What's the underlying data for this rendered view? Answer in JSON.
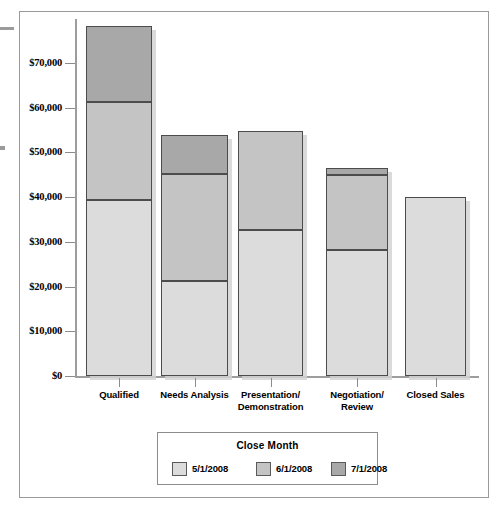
{
  "chart_data": {
    "type": "bar",
    "subtype": "stacked-vertical",
    "title": "",
    "xlabel": "",
    "ylabel": "",
    "categories": [
      "Qualified",
      "Needs Analysis",
      "Presentation/ Demonstration",
      "Negotiation/ Review",
      "Closed Sales"
    ],
    "category_lines": [
      [
        "Qualified"
      ],
      [
        "Needs Analysis"
      ],
      [
        "Presentation/",
        "Demonstration"
      ],
      [
        "Negotiation/",
        "Review"
      ],
      [
        "Closed Sales"
      ]
    ],
    "legend_title": "Close Month",
    "legend_position": "bottom",
    "grid": false,
    "ylim": [
      0,
      80000
    ],
    "yticks": [
      0,
      10000,
      20000,
      30000,
      40000,
      50000,
      60000,
      70000
    ],
    "ytick_labels": [
      "$0",
      "$10,000",
      "$20,000",
      "$30,000",
      "$40,000",
      "$50,000",
      "$60,000",
      "$70,000"
    ],
    "series": [
      {
        "name": "5/1/2008",
        "color": "#dcdcdc",
        "values": [
          39400,
          21300,
          32700,
          28200,
          39900
        ]
      },
      {
        "name": "6/1/2008",
        "color": "#c4c4c4",
        "values": [
          21900,
          23900,
          22100,
          16800,
          0
        ]
      },
      {
        "name": "7/1/2008",
        "color": "#a8a8a8",
        "values": [
          17000,
          8700,
          0,
          1500,
          0
        ]
      }
    ],
    "totals": [
      78300,
      53900,
      54800,
      46500,
      39900
    ],
    "axis_color": "#9d9d9d",
    "bar_border_color": "#4c4c4c"
  }
}
